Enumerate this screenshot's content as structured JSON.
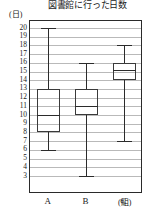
{
  "chart_data": {
    "type": "box",
    "title": "図書館に行った日数",
    "ylabel": "(日)",
    "xlabel": "(組)",
    "categories": [
      "A",
      "B",
      "C"
    ],
    "ylim": [
      3,
      20
    ],
    "yticks": [
      20,
      19,
      18,
      17,
      16,
      15,
      14,
      13,
      12,
      11,
      10,
      9,
      8,
      7,
      6,
      5,
      4,
      3
    ],
    "grid": true,
    "legend": "none",
    "series": [
      {
        "name": "A",
        "min": 6,
        "q1": 8,
        "median": 10,
        "q3": 13,
        "max": 20
      },
      {
        "name": "B",
        "min": 3,
        "q1": 10,
        "median": 11,
        "q3": 13,
        "max": 16
      },
      {
        "name": "C",
        "min": 7,
        "q1": 14,
        "median": 15.2,
        "q3": 16,
        "max": 18
      }
    ]
  },
  "colors": {
    "axis": "#2a2a2a",
    "grid": "#b9b9b9",
    "box_stroke": "#3a3a3a",
    "whisker": "#2b2b2b",
    "text": "#1a1a1a",
    "background": "#ffffff"
  }
}
